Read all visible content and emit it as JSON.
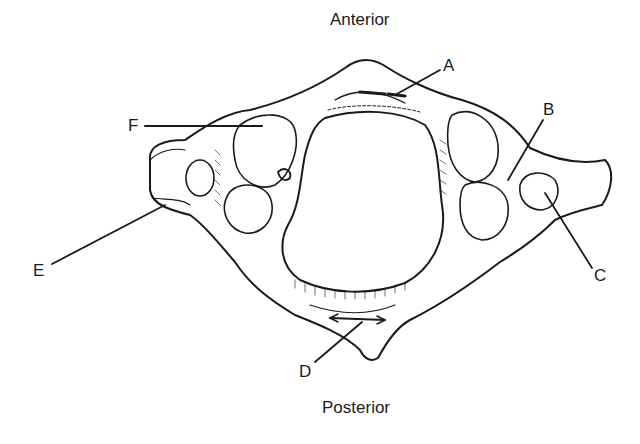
{
  "diagram": {
    "orientation": {
      "top": "Anterior",
      "bottom": "Posterior"
    },
    "labels": [
      {
        "id": "A",
        "text": "A"
      },
      {
        "id": "B",
        "text": "B"
      },
      {
        "id": "C",
        "text": "C"
      },
      {
        "id": "D",
        "text": "D"
      },
      {
        "id": "E",
        "text": "E"
      },
      {
        "id": "F",
        "text": "F"
      }
    ],
    "colors": {
      "ink": "#1a1a1a",
      "background": "#ffffff"
    }
  }
}
